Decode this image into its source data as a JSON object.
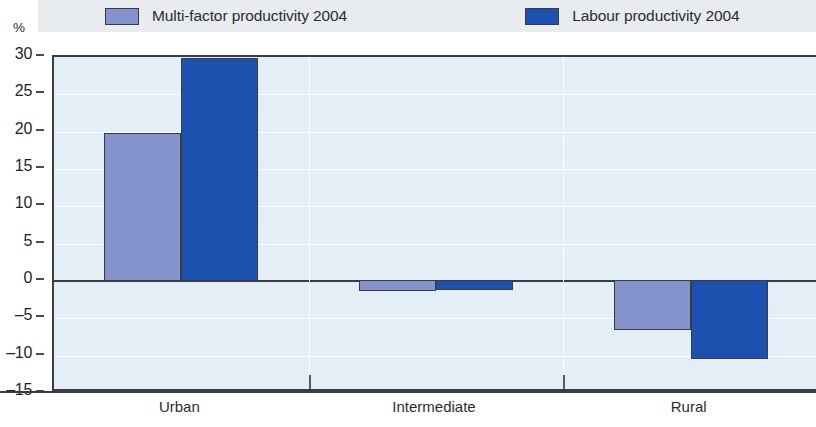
{
  "axis": {
    "unit_label": "%",
    "y_ticks": [
      "30",
      "25",
      "20",
      "15",
      "10",
      "5",
      "0",
      "-5",
      "-10",
      "-15"
    ]
  },
  "legend": {
    "items": [
      {
        "label": "Multi-factor productivity 2004",
        "swatch": "legend-swatch-mfp",
        "color": "#8493cb"
      },
      {
        "label": "Labour productivity 2004",
        "swatch": "legend-swatch-labour",
        "color": "#1d51b0"
      }
    ]
  },
  "chart_data": {
    "type": "bar",
    "title": "",
    "subtitle": "",
    "xlabel": "",
    "ylabel": "%",
    "ylim": [
      -15,
      30
    ],
    "ytick_step": 5,
    "grid": true,
    "legend_position": "top",
    "categories": [
      "Urban",
      "Intermediate",
      "Rural"
    ],
    "series": [
      {
        "name": "Multi-factor productivity 2004",
        "color": "#8493cb",
        "values": [
          19.7,
          -1.3,
          -6.6
        ]
      },
      {
        "name": "Labour productivity 2004",
        "color": "#1d51b0",
        "values": [
          29.7,
          -1.2,
          -10.4
        ]
      }
    ]
  }
}
